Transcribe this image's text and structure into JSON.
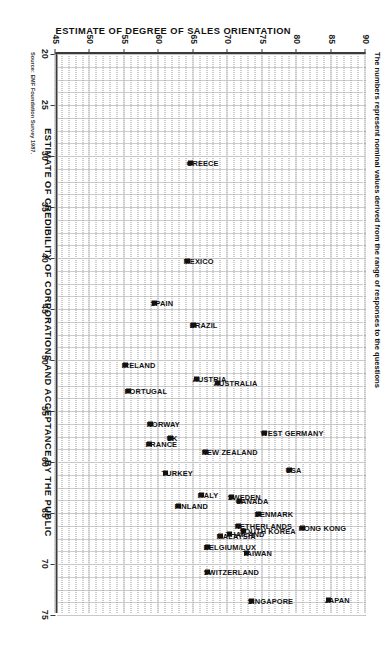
{
  "note": "The numbers represent nominal values derived from the range of responses to the questions",
  "source": "Source: EMF Foundation Survey 1987.",
  "chart_data": {
    "type": "scatter",
    "title": "",
    "xlabel": "ESTIMATE OF CREDIBILITY OF CORPORATIONS AND ACCEPTANCE BY THE PUBLIC",
    "ylabel": "ESTIMATE OF DEGREE OF SALES ORIENTATION",
    "xlim": [
      20,
      75
    ],
    "ylim": [
      45,
      90
    ],
    "xticks": [
      20,
      25,
      30,
      35,
      40,
      45,
      50,
      55,
      60,
      65,
      70,
      75
    ],
    "yticks": [
      45,
      50,
      55,
      60,
      65,
      70,
      75,
      80,
      85,
      90
    ],
    "grid": true,
    "legend": "none",
    "points": [
      {
        "label": "JAPAN",
        "x": 73.5,
        "y": 84.7
      },
      {
        "label": "HONG KONG",
        "x": 66.5,
        "y": 80.8
      },
      {
        "label": "SINGAPORE",
        "x": 73.6,
        "y": 73.5
      },
      {
        "label": "USA",
        "x": 60.8,
        "y": 79.0
      },
      {
        "label": "SOUTH KOREA",
        "x": 66.8,
        "y": 72.3
      },
      {
        "label": "TAIWAN",
        "x": 68.9,
        "y": 72.7
      },
      {
        "label": "DENMARK",
        "x": 65.1,
        "y": 74.5
      },
      {
        "label": "NETHERLANDS",
        "x": 66.3,
        "y": 71.5
      },
      {
        "label": "THAILAND",
        "x": 67.1,
        "y": 70.2
      },
      {
        "label": "MALAYSIA",
        "x": 67.3,
        "y": 68.9
      },
      {
        "label": "SWITZERLAND",
        "x": 70.8,
        "y": 67.1
      },
      {
        "label": "BELGIUM/LUX",
        "x": 68.3,
        "y": 67.1
      },
      {
        "label": "CANADA",
        "x": 63.8,
        "y": 71.7
      },
      {
        "label": "SWEDEN",
        "x": 63.4,
        "y": 70.6
      },
      {
        "label": "ITALY",
        "x": 63.2,
        "y": 66.2
      },
      {
        "label": "FINLAND",
        "x": 64.3,
        "y": 62.8
      },
      {
        "label": "TURKEY",
        "x": 61.1,
        "y": 61.0
      },
      {
        "label": "WEST GERMANY",
        "x": 57.2,
        "y": 75.3
      },
      {
        "label": "NEW ZEALAND",
        "x": 59.0,
        "y": 66.8
      },
      {
        "label": "AUSTRALIA",
        "x": 52.3,
        "y": 68.5
      },
      {
        "label": "AUSTRIA",
        "x": 51.9,
        "y": 65.5
      },
      {
        "label": "UK",
        "x": 57.6,
        "y": 61.7
      },
      {
        "label": "NORWAY",
        "x": 56.3,
        "y": 58.8
      },
      {
        "label": "FRANCE",
        "x": 58.2,
        "y": 58.6
      },
      {
        "label": "PORTUGAL",
        "x": 53.0,
        "y": 55.6
      },
      {
        "label": "IRELAND",
        "x": 50.5,
        "y": 55.2
      },
      {
        "label": "BRAZIL",
        "x": 46.6,
        "y": 65.1
      },
      {
        "label": "SPAIN",
        "x": 44.4,
        "y": 59.4
      },
      {
        "label": "MEXICO",
        "x": 40.3,
        "y": 64.2
      },
      {
        "label": "GREECE",
        "x": 30.7,
        "y": 64.6
      }
    ]
  }
}
